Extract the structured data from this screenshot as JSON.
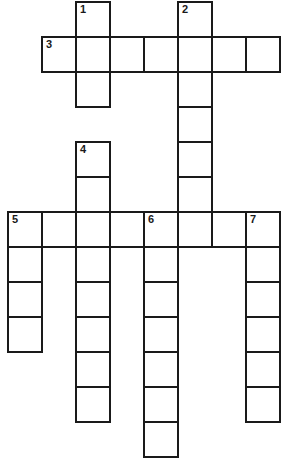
{
  "puzzle": {
    "type": "crossword",
    "grid": {
      "origin_x": 7,
      "origin_y": 1,
      "cell_w": 34,
      "cell_h": 35,
      "border_color": "#1a1a1a",
      "background": "#ffffff"
    },
    "clues": [
      {
        "number": "1",
        "direction": "down",
        "row": 0,
        "col": 2,
        "length": 3
      },
      {
        "number": "2",
        "direction": "down",
        "row": 0,
        "col": 5,
        "length": 7
      },
      {
        "number": "3",
        "direction": "across",
        "row": 1,
        "col": 1,
        "length": 7
      },
      {
        "number": "4",
        "direction": "down",
        "row": 4,
        "col": 2,
        "length": 8
      },
      {
        "number": "5",
        "direction": "across",
        "row": 6,
        "col": 0,
        "length": 8
      },
      {
        "number": "5",
        "direction": "down",
        "row": 6,
        "col": 0,
        "length": 4
      },
      {
        "number": "6",
        "direction": "down",
        "row": 6,
        "col": 4,
        "length": 7
      },
      {
        "number": "7",
        "direction": "down",
        "row": 6,
        "col": 7,
        "length": 6
      }
    ],
    "numbers": [
      {
        "label": "1",
        "row": 0,
        "col": 2
      },
      {
        "label": "2",
        "row": 0,
        "col": 5
      },
      {
        "label": "3",
        "row": 1,
        "col": 1
      },
      {
        "label": "4",
        "row": 4,
        "col": 2
      },
      {
        "label": "5",
        "row": 6,
        "col": 0
      },
      {
        "label": "6",
        "row": 6,
        "col": 4
      },
      {
        "label": "7",
        "row": 6,
        "col": 7
      }
    ]
  }
}
